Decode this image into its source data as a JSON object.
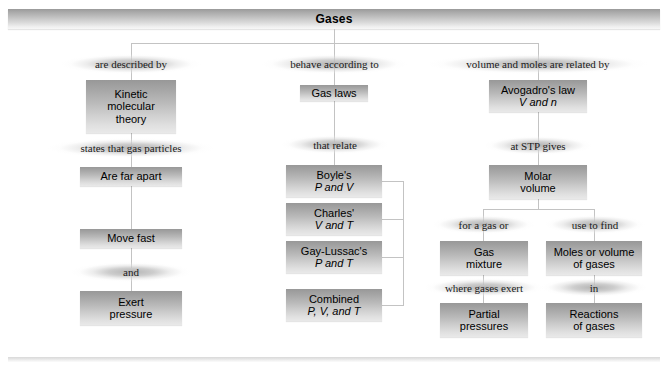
{
  "map": {
    "title": "Gases"
  },
  "branches": {
    "left": {
      "connector1": "are described by",
      "box1": "Kinetic\nmolecular\ntheory",
      "connector2": "states that gas particles",
      "box2": "Are far apart",
      "box3": "Move fast",
      "connector3": "and",
      "box4": "Exert\npressure"
    },
    "middle": {
      "connector1": "behave according to",
      "box1": "Gas laws",
      "connector2": "that relate",
      "law1_name": "Boyle's",
      "law1_vars": "P and V",
      "law2_name": "Charles'",
      "law2_vars": "V and T",
      "law3_name": "Gay-Lussac's",
      "law3_vars": "P and T",
      "law4_name": "Combined",
      "law4_vars": "P, V, and T"
    },
    "right": {
      "connector1": "volume and moles are related by",
      "box1_line1": "Avogadro's law",
      "box1_line2": "V and n",
      "connector2": "at STP gives",
      "box2": "Molar\nvolume",
      "left_sub": {
        "connector1": "for a gas or",
        "box1": "Gas\nmixture",
        "connector2": "where gases exert",
        "box2": "Partial\npressures"
      },
      "right_sub": {
        "connector1": "use to find",
        "box1": "Moles or volume\nof gases",
        "connector2": "in",
        "box2": "Reactions\nof gases"
      }
    }
  },
  "colors": {
    "box_top": "#989898",
    "box_bottom": "#e9e9e9",
    "line": "#c3c3c3",
    "text": "#000000"
  }
}
